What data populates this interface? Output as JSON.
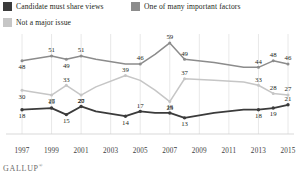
{
  "legend": {
    "items": [
      {
        "label": "Candidate must share views",
        "color": "#3b3b3b"
      },
      {
        "label": "One of many important factors",
        "color": "#8c8c8c"
      },
      {
        "label": "Not a major issue",
        "color": "#c6c6c6"
      }
    ]
  },
  "footer": {
    "brand": "GALLUP",
    "mark": "®"
  },
  "chart_data": {
    "type": "line",
    "title": "",
    "subtitle": "",
    "xlabel": "",
    "ylabel": "",
    "ylim": [
      0,
      70
    ],
    "grid": true,
    "legend_position": "top-left",
    "x": [
      1997,
      1999,
      2000,
      2001,
      2002,
      2004,
      2005,
      2006,
      2007,
      2008,
      2010,
      2012,
      2013,
      2014,
      2015
    ],
    "tick_labels": [
      "1997",
      "1999",
      "2001",
      "2003",
      "2005",
      "2007",
      "2009",
      "2011",
      "2013",
      "2015"
    ],
    "ticks": [
      1997,
      1999,
      2001,
      2003,
      2005,
      2007,
      2009,
      2011,
      2013,
      2015
    ],
    "series": [
      {
        "name": "Candidate must share views",
        "color": "#3b3b3b",
        "values": [
          18,
          19,
          15,
          20,
          17,
          14,
          17,
          16,
          16,
          13,
          16,
          18,
          18,
          19,
          21
        ],
        "labels": [
          "18",
          "19",
          "15",
          "20",
          "",
          "14",
          "17",
          "",
          "16",
          "13",
          "",
          "",
          "18",
          "19",
          "21"
        ]
      },
      {
        "name": "One of many important factors",
        "color": "#8c8c8c",
        "values": [
          48,
          51,
          49,
          51,
          49,
          46,
          46,
          52,
          59,
          49,
          47,
          44,
          44,
          48,
          46
        ],
        "labels": [
          "48",
          "51",
          "49",
          "51",
          "",
          "",
          "46",
          "",
          "59",
          "49",
          "",
          "",
          "44",
          "48",
          "46"
        ]
      },
      {
        "name": "Not a major issue",
        "color": "#c6c6c6",
        "values": [
          30,
          27,
          33,
          27,
          32,
          39,
          36,
          30,
          23,
          37,
          36,
          35,
          33,
          28,
          27
        ],
        "labels": [
          "30",
          "27",
          "33",
          "27",
          "",
          "39",
          "",
          "",
          "23",
          "37",
          "",
          "",
          "33",
          "28",
          "27"
        ]
      }
    ]
  }
}
